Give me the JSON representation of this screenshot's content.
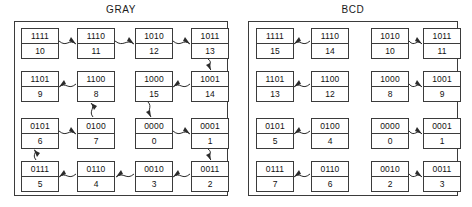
{
  "diagram": {
    "panels": [
      {
        "name": "gray",
        "label": "GRAY",
        "cells": [
          {
            "code": "1111",
            "dec": "10"
          },
          {
            "code": "1110",
            "dec": "11"
          },
          {
            "code": "1010",
            "dec": "12"
          },
          {
            "code": "1011",
            "dec": "13"
          },
          {
            "code": "1101",
            "dec": "9"
          },
          {
            "code": "1100",
            "dec": "8"
          },
          {
            "code": "1000",
            "dec": "15"
          },
          {
            "code": "1001",
            "dec": "14"
          },
          {
            "code": "0101",
            "dec": "6"
          },
          {
            "code": "0100",
            "dec": "7"
          },
          {
            "code": "0000",
            "dec": "0"
          },
          {
            "code": "0001",
            "dec": "1"
          },
          {
            "code": "0111",
            "dec": "5"
          },
          {
            "code": "0110",
            "dec": "4"
          },
          {
            "code": "0010",
            "dec": "3"
          },
          {
            "code": "0011",
            "dec": "2"
          }
        ]
      },
      {
        "name": "bcd",
        "label": "BCD",
        "cells": [
          {
            "code": "1111",
            "dec": "15"
          },
          {
            "code": "1110",
            "dec": "14"
          },
          {
            "code": "1010",
            "dec": "10"
          },
          {
            "code": "1011",
            "dec": "11"
          },
          {
            "code": "1101",
            "dec": "13"
          },
          {
            "code": "1100",
            "dec": "12"
          },
          {
            "code": "1000",
            "dec": "8"
          },
          {
            "code": "1001",
            "dec": "9"
          },
          {
            "code": "0101",
            "dec": "5"
          },
          {
            "code": "0100",
            "dec": "4"
          },
          {
            "code": "0000",
            "dec": "0"
          },
          {
            "code": "0001",
            "dec": "1"
          },
          {
            "code": "0111",
            "dec": "7"
          },
          {
            "code": "0110",
            "dec": "6"
          },
          {
            "code": "0010",
            "dec": "2"
          },
          {
            "code": "0011",
            "dec": "3"
          }
        ]
      }
    ],
    "colors": {
      "stroke": "#3b3b3b",
      "arrow": "#2b2b2b",
      "text": "#111111",
      "background": "#ffffff"
    }
  }
}
